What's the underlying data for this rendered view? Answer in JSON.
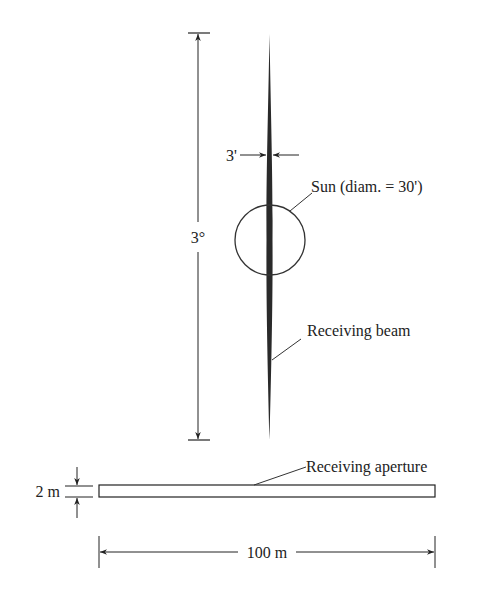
{
  "diagram": {
    "type": "antenna-beam-vs-sun",
    "colors": {
      "ink": "#222222",
      "beam": "#2a2a2a",
      "background": "#ffffff"
    },
    "labels": {
      "beam_width": "3'",
      "beam_length_angle": "3°",
      "sun": "Sun (diam. = 30')",
      "receiving_beam": "Receiving beam",
      "receiving_aperture": "Receiving aperture",
      "aperture_height": "2 m",
      "aperture_width": "100 m"
    },
    "elements": {
      "receiving_beam": {
        "shape": "thin vertical lens",
        "width_arcmin": 3,
        "length_deg": 3
      },
      "sun": {
        "shape": "circle",
        "diameter_arcmin": 30
      },
      "receiving_aperture": {
        "shape": "rectangle",
        "width_m": 100,
        "height_m": 2
      }
    }
  }
}
